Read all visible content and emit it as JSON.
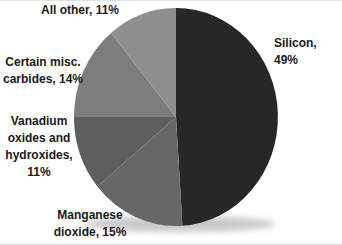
{
  "chart_data": {
    "type": "pie",
    "title": "",
    "legend": "none",
    "direction": "clockwise",
    "start_angle_deg": 0,
    "background": "#ffffff",
    "label_color": "#1a1a1a",
    "slices": [
      {
        "label": "Silicon",
        "value": 49,
        "display": "Silicon, 49%",
        "color": "#272727"
      },
      {
        "label": "Manganese dioxide",
        "value": 15,
        "display": "Manganese\ndioxide, 15%",
        "color": "#676767"
      },
      {
        "label": "Vanadium oxides and hydroxides",
        "value": 11,
        "display": "Vanadium\noxides and\nhydroxides,\n11%",
        "color": "#5e5e5e"
      },
      {
        "label": "Certain misc. carbides",
        "value": 14,
        "display": "Certain misc.\ncarbides, 14%",
        "color": "#7d7d7d"
      },
      {
        "label": "All other",
        "value": 11,
        "display": "All other, 11%",
        "color": "#8f8f8f"
      }
    ]
  }
}
